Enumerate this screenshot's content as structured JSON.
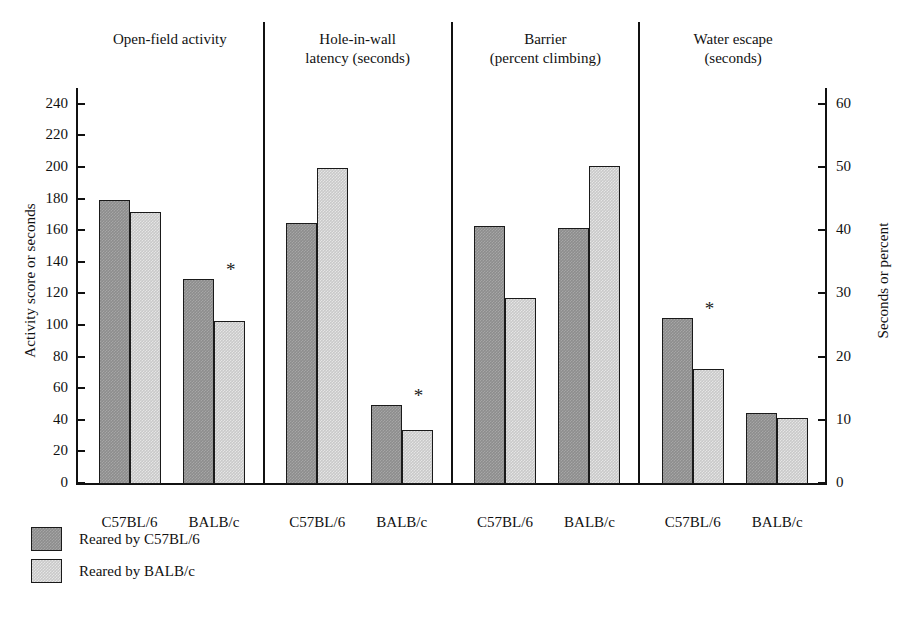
{
  "chart_data": {
    "type": "bar",
    "title": "",
    "subtitle": "",
    "grid": false,
    "legend_position": "bottom-left",
    "ylabel": "Activity score or seconds",
    "ylabel_right": "Seconds or percent",
    "xlabel": "",
    "ylim": [
      0,
      250
    ],
    "ylim_right": [
      0,
      62.5
    ],
    "yticks": [
      0,
      20,
      40,
      60,
      80,
      100,
      120,
      140,
      160,
      180,
      200,
      220,
      240
    ],
    "yticklabels": [
      "0",
      "20",
      "40",
      "60",
      "80",
      "100",
      "120",
      "140",
      "160",
      "180",
      "200",
      "220",
      "240"
    ],
    "yticks_right": [
      0,
      10,
      20,
      30,
      40,
      50,
      60
    ],
    "yticklabels_right": [
      "0",
      "10",
      "20",
      "30",
      "40",
      "50",
      "60"
    ],
    "categories": [
      "C57BL/6",
      "BALB/c"
    ],
    "series": [
      {
        "name": "Reared by C57BL/6",
        "color": "#8d8d8d"
      },
      {
        "name": "Reared by BALB/c",
        "color": "#c9c9c9"
      }
    ],
    "panels": [
      {
        "title": "Open-field activity",
        "scale": "left",
        "groups": [
          {
            "label": "C57BL/6",
            "values": [
              180,
              172
            ],
            "significant": false
          },
          {
            "label": "BALB/c",
            "values": [
              130,
              103
            ],
            "significant": true
          }
        ]
      },
      {
        "title": "Hole-in-wall\nlatency (seconds)",
        "scale": "left",
        "groups": [
          {
            "label": "C57BL/6",
            "values": [
              165,
              200
            ],
            "significant": false
          },
          {
            "label": "BALB/c",
            "values": [
              50,
              34
            ],
            "significant": true
          }
        ]
      },
      {
        "title": "Barrier\n(percent climbing)",
        "scale": "left",
        "groups": [
          {
            "label": "C57BL/6",
            "values": [
              163,
              118
            ],
            "significant": false
          },
          {
            "label": "BALB/c",
            "values": [
              162,
              201
            ],
            "significant": false
          }
        ]
      },
      {
        "title": "Water escape\n(seconds)",
        "scale": "left",
        "groups": [
          {
            "label": "C57BL/6",
            "values": [
              105,
              73
            ],
            "significant": true
          },
          {
            "label": "BALB/c",
            "values": [
              45,
              42
            ],
            "significant": false
          }
        ]
      }
    ],
    "annotations": [
      {
        "symbol": "*",
        "panel": 0,
        "group": 1
      },
      {
        "symbol": "*",
        "panel": 1,
        "group": 1
      },
      {
        "symbol": "*",
        "panel": 3,
        "group": 0
      }
    ],
    "significance_symbol": "*"
  },
  "legend": {
    "items": [
      {
        "label": "Reared by C57BL/6",
        "color": "#8d8d8d",
        "style": "dark"
      },
      {
        "label": "Reared by BALB/c",
        "color": "#c9c9c9",
        "style": "light"
      }
    ]
  },
  "colors": {
    "bar_dark": "#8d8d8d",
    "bar_light": "#c9c9c9",
    "outline": "#1a1a1a",
    "background": "#ffffff"
  }
}
